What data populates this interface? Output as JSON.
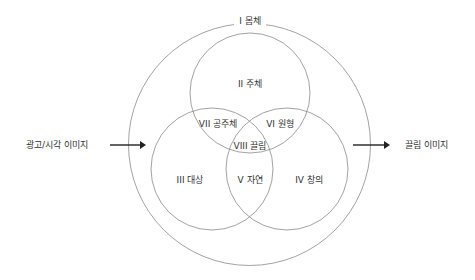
{
  "diagram": {
    "outer_circle": {
      "label": "I 몸체",
      "cx": 249.5,
      "cy": 144.5,
      "r": 121
    },
    "circles": [
      {
        "id": "top",
        "label": "II 주체",
        "cx": 250,
        "cy": 93,
        "r": 60
      },
      {
        "id": "bottom-left",
        "label": "III 대상",
        "cx": 212,
        "cy": 169,
        "r": 61
      },
      {
        "id": "bottom-right",
        "label": "IV 창의",
        "cx": 287,
        "cy": 169,
        "r": 61
      }
    ],
    "regions": {
      "II": "II 주체",
      "III": "III 대상",
      "IV": "IV 창의",
      "V": "V 자연",
      "VI": "VI 원형",
      "VII": "VII 공주체",
      "VIII": "VIII 끌림"
    },
    "input": {
      "label": "광고/시각 이미지"
    },
    "output": {
      "label": "끌림 이미지"
    },
    "colors": {
      "circle_stroke": "#8a8a8a",
      "text": "#333333",
      "arrow": "#222222"
    }
  }
}
